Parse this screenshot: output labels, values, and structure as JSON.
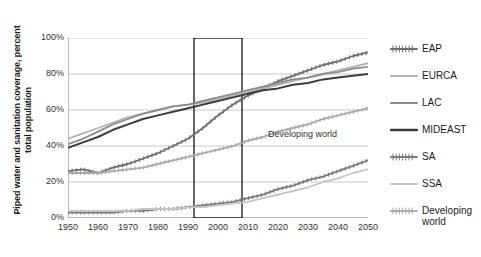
{
  "chart_data": {
    "type": "line",
    "title": "",
    "xlabel": "",
    "ylabel": "Piped water and sanitation coverage, percent total population",
    "ylabel_line1": "Piped water and sanitation coverage, percent",
    "ylabel_line2": "total population",
    "xlim": [
      1950,
      2050
    ],
    "ylim": [
      0,
      100
    ],
    "ytick_labels": [
      "0%",
      "20%",
      "40%",
      "60%",
      "80%",
      "100%"
    ],
    "ytick_values": [
      0,
      20,
      40,
      60,
      80,
      100
    ],
    "xtick_labels": [
      "1950",
      "1960",
      "1970",
      "1980",
      "1990",
      "2000",
      "2010",
      "2020",
      "2030",
      "2040",
      "2050"
    ],
    "xtick_values": [
      1950,
      1960,
      1970,
      1980,
      1990,
      2000,
      2010,
      2020,
      2030,
      2040,
      2050
    ],
    "grid": "horizontal",
    "legend_position": "right",
    "x": [
      1950,
      1955,
      1960,
      1965,
      1970,
      1975,
      1980,
      1985,
      1990,
      1995,
      2000,
      2005,
      2010,
      2015,
      2020,
      2025,
      2030,
      2035,
      2040,
      2045,
      2050
    ],
    "series": [
      {
        "name": "EAP",
        "color": "#6e6e6e",
        "marker": "cross",
        "values": [
          26,
          27,
          25,
          28,
          30,
          33,
          36,
          40,
          44,
          50,
          57,
          63,
          68,
          72,
          76,
          79,
          82,
          85,
          87,
          90,
          92
        ]
      },
      {
        "name": "EURCA",
        "color": "#b4b4b4",
        "marker": "none",
        "values": [
          44,
          47,
          50,
          53,
          56,
          58,
          60,
          62,
          63,
          64,
          66,
          68,
          70,
          72,
          74,
          76,
          78,
          80,
          82,
          84,
          86
        ]
      },
      {
        "name": "LAC",
        "color": "#8c8c8c",
        "marker": "none",
        "values": [
          41,
          44,
          48,
          52,
          55,
          58,
          60,
          62,
          63,
          65,
          67,
          69,
          71,
          73,
          75,
          77,
          78,
          80,
          81,
          83,
          84
        ]
      },
      {
        "name": "MIDEAST",
        "color": "#3c3c3c",
        "marker": "none",
        "values": [
          39,
          42,
          45,
          49,
          52,
          55,
          57,
          59,
          61,
          63,
          65,
          67,
          69,
          71,
          72,
          74,
          75,
          77,
          78,
          79,
          80
        ]
      },
      {
        "name": "SA",
        "color": "#7a7a7a",
        "marker": "cross",
        "values": [
          3,
          3,
          3,
          3,
          4,
          4,
          5,
          5,
          6,
          7,
          8,
          9,
          11,
          13,
          16,
          18,
          21,
          23,
          26,
          29,
          32
        ]
      },
      {
        "name": "SSA",
        "color": "#c4c4c4",
        "marker": "none",
        "values": [
          4,
          4,
          4,
          4,
          4,
          5,
          5,
          5,
          6,
          6,
          7,
          8,
          9,
          11,
          13,
          15,
          17,
          20,
          22,
          25,
          27
        ]
      },
      {
        "name": "Developing world",
        "color": "#aaaaaa",
        "marker": "cross",
        "values": [
          25,
          25,
          25,
          26,
          27,
          28,
          30,
          32,
          34,
          36,
          38,
          40,
          43,
          45,
          48,
          50,
          52,
          55,
          57,
          59,
          61
        ]
      }
    ],
    "annotations": [
      {
        "text": "Developing world",
        "x": 2016,
        "y": 46
      }
    ],
    "highlight_box": {
      "x_start": 1992,
      "x_end": 2008,
      "y_start": 0,
      "y_end": 100,
      "color": "#000000"
    }
  },
  "legend": {
    "items": [
      {
        "label": "EAP"
      },
      {
        "label": "EURCA"
      },
      {
        "label": "LAC"
      },
      {
        "label": "MIDEAST"
      },
      {
        "label": "SA"
      },
      {
        "label": "SSA"
      },
      {
        "label": "Developing\nworld"
      }
    ]
  },
  "caption": {
    "text": ""
  }
}
